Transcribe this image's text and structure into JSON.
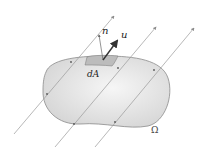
{
  "diagram": {
    "region_label": "Ω",
    "element_label": "dA",
    "normal_label": "n",
    "velocity_label": "u",
    "colors": {
      "region_fill": "#e2e2e2",
      "region_stroke": "#8a8a8a",
      "flow_line": "#9a9a9a",
      "element_fill": "#bcbcbc",
      "vector": "#333333",
      "background": "#ffffff"
    },
    "flow_lines": 3
  }
}
